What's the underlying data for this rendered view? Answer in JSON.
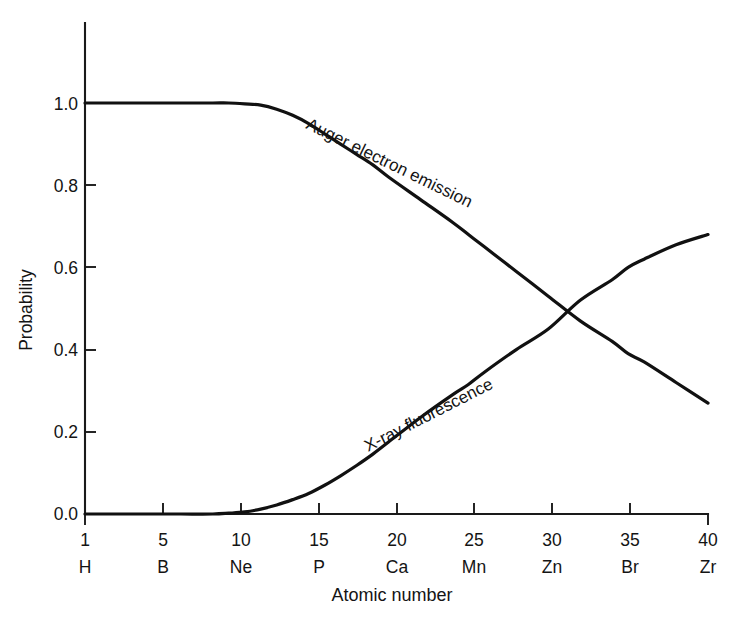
{
  "figure": {
    "type": "scientific-line-chart",
    "background_color": "#ffffff",
    "line_color": "#111111"
  },
  "chart_data": {
    "type": "line",
    "title": "",
    "subtitle": "",
    "xlabel": "Atomic number",
    "ylabel": "Probability",
    "xlim": [
      1,
      40
    ],
    "ylim": [
      0.0,
      1.0
    ],
    "grid": false,
    "legend": "inline-curve-labels",
    "x_ticks": [
      1,
      5,
      10,
      15,
      20,
      25,
      30,
      35,
      40
    ],
    "x_tick_labels": [
      "1",
      "5",
      "10",
      "15",
      "20",
      "25",
      "30",
      "35",
      "40"
    ],
    "x_tick_elements": [
      "H",
      "B",
      "Ne",
      "P",
      "Ca",
      "Mn",
      "Zn",
      "Br",
      "Zr"
    ],
    "y_ticks": [
      0.0,
      0.2,
      0.4,
      0.6,
      0.8,
      1.0
    ],
    "y_tick_labels": [
      "0.0",
      "0.2",
      "0.4",
      "0.6",
      "0.8",
      "1.0"
    ],
    "x": [
      1,
      3,
      5,
      7,
      9,
      10,
      11,
      12,
      13,
      14,
      15,
      16,
      17,
      18,
      19,
      20,
      22,
      24,
      25,
      26,
      28,
      30,
      32,
      34,
      35,
      36,
      38,
      40
    ],
    "series": [
      {
        "name": "Auger electron emission",
        "label": "Auger electron emission",
        "label_rotation_deg": 26,
        "values": [
          1.0,
          1.0,
          1.0,
          1.0,
          1.0,
          1.0,
          0.998,
          0.995,
          0.985,
          0.97,
          0.95,
          0.925,
          0.9,
          0.875,
          0.85,
          0.82,
          0.765,
          0.71,
          0.68,
          0.65,
          0.59,
          0.53,
          0.47,
          0.42,
          0.39,
          0.37,
          0.32,
          0.27
        ]
      },
      {
        "name": "X-ray fluorescence",
        "label": "X-ray fluorescence",
        "label_rotation_deg": -27,
        "values": [
          0.0,
          0.0,
          0.0,
          0.0,
          0.0,
          0.002,
          0.005,
          0.012,
          0.022,
          0.035,
          0.05,
          0.07,
          0.093,
          0.118,
          0.145,
          0.175,
          0.235,
          0.29,
          0.315,
          0.345,
          0.4,
          0.45,
          0.52,
          0.57,
          0.6,
          0.62,
          0.655,
          0.68
        ]
      }
    ],
    "crossing_point": {
      "x": 34,
      "y": 0.48
    }
  },
  "axis_titles": {
    "x": "Atomic number",
    "y": "Probability"
  }
}
